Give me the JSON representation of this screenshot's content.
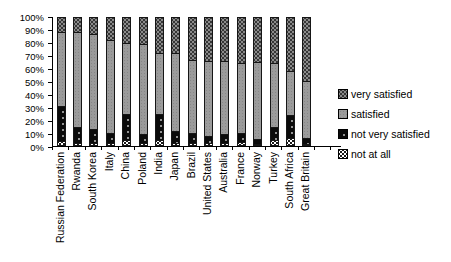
{
  "colors": {
    "very_satisfied": "#363636",
    "satisfied": "#9b9b9b",
    "not_very_satisfied": "#0b0b0b",
    "not_at_all": "#ffffff",
    "axis": "#000000",
    "background": "#ffffff"
  },
  "legend": {
    "position": "right",
    "items": [
      {
        "key": "very_satisfied",
        "label": "very satisfied"
      },
      {
        "key": "satisfied",
        "label": "satisfied"
      },
      {
        "key": "not_very_satisfied",
        "label": "not very satisfied"
      },
      {
        "key": "not_at_all",
        "label": "not at all"
      }
    ]
  },
  "chart_data": {
    "type": "bar",
    "subtype": "100%-stacked-column",
    "title": "",
    "xlabel": "",
    "ylabel": "",
    "ylim": [
      0,
      100
    ],
    "grid": false,
    "legend_position": "right",
    "y_ticks": [
      "100%",
      "90%",
      "80%",
      "70%",
      "60%",
      "50%",
      "40%",
      "30%",
      "20%",
      "10%",
      "0%"
    ],
    "categories": [
      "Russian Federation",
      "Rwanda",
      "South Korea",
      "Italy",
      "China",
      "Poland",
      "India",
      "Japan",
      "Brazil",
      "United States",
      "Australia",
      "France",
      "Norway",
      "Turkey",
      "South Africa",
      "Great Britain"
    ],
    "stack_order_top_to_bottom": [
      "very_satisfied",
      "satisfied",
      "not_very_satisfied",
      "not_at_all"
    ],
    "series": [
      {
        "name": "very satisfied",
        "key": "very_satisfied",
        "values": [
          12,
          12,
          13,
          18,
          20,
          21,
          28,
          28,
          33,
          34,
          34,
          36,
          35,
          36,
          42,
          50
        ]
      },
      {
        "name": "satisfied",
        "key": "satisfied",
        "values": [
          57,
          73,
          74,
          72,
          55,
          70,
          47,
          60,
          57,
          58,
          57,
          54,
          60,
          49,
          34,
          44
        ]
      },
      {
        "name": "not very satisfied",
        "key": "not_very_satisfied",
        "values": [
          27,
          13,
          11,
          8,
          20,
          7,
          20,
          10,
          8,
          6,
          7,
          7,
          4,
          10,
          18,
          5
        ]
      },
      {
        "name": "not at all",
        "key": "not_at_all",
        "values": [
          4,
          2,
          2,
          2,
          5,
          2,
          5,
          2,
          2,
          2,
          2,
          3,
          1,
          5,
          6,
          1
        ]
      }
    ]
  }
}
